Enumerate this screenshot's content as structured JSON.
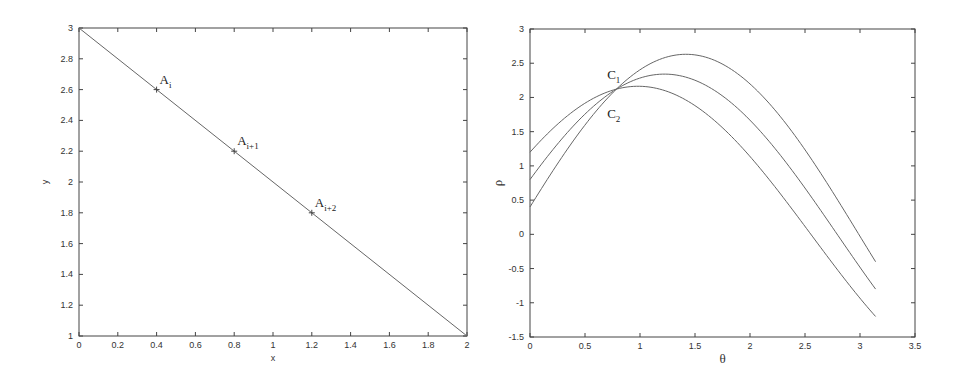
{
  "chart_data": [
    {
      "type": "line",
      "title": "",
      "xlabel": "x",
      "ylabel": "y",
      "xlim": [
        0,
        2
      ],
      "ylim": [
        1,
        3
      ],
      "grid": false,
      "xticks": [
        "0",
        "0.2",
        "0.4",
        "0.6",
        "0.8",
        "1",
        "1.2",
        "1.4",
        "1.6",
        "1.8",
        "2"
      ],
      "yticks": [
        "1",
        "1.2",
        "1.4",
        "1.6",
        "1.8",
        "2",
        "2.2",
        "2.4",
        "2.6",
        "2.8",
        "3"
      ],
      "series": [
        {
          "name": "line",
          "x": [
            0,
            2
          ],
          "y": [
            3,
            1
          ]
        }
      ],
      "markers": [
        {
          "x": 0.4,
          "y": 2.6,
          "label": "A",
          "sub": "i"
        },
        {
          "x": 0.8,
          "y": 2.2,
          "label": "A",
          "sub": "i+1"
        },
        {
          "x": 1.2,
          "y": 1.8,
          "label": "A",
          "sub": "i+2"
        }
      ]
    },
    {
      "type": "line",
      "title": "",
      "xlabel": "θ",
      "ylabel": "ρ",
      "xlim": [
        0,
        3.5
      ],
      "ylim": [
        -1.5,
        3
      ],
      "grid": false,
      "xticks": [
        "0",
        "0.5",
        "1",
        "1.5",
        "2",
        "2.5",
        "3",
        "3.5"
      ],
      "yticks": [
        "-1.5",
        "-1",
        "-0.5",
        "0",
        "0.5",
        "1",
        "1.5",
        "2",
        "2.5",
        "3"
      ],
      "series": [
        {
          "name": "ρ = 0.4cosθ + 2.6sinθ",
          "x_point": 0.4,
          "y_point": 2.6,
          "theta_range": [
            0,
            3.1416
          ],
          "start": 0.4,
          "peak": 2.63,
          "end": -0.4
        },
        {
          "name": "ρ = 0.8cosθ + 2.2sinθ",
          "x_point": 0.8,
          "y_point": 2.2,
          "theta_range": [
            0,
            3.1416
          ],
          "start": 0.8,
          "peak": 2.34,
          "end": -0.8
        },
        {
          "name": "ρ = 1.2cosθ + 1.8sinθ",
          "x_point": 1.2,
          "y_point": 1.8,
          "theta_range": [
            0,
            3.1416
          ],
          "start": 1.2,
          "peak": 2.16,
          "end": -1.2
        }
      ],
      "annotations": [
        {
          "label": "C",
          "sub": "1",
          "theta": 0.72,
          "rho": 2.3
        },
        {
          "label": "C",
          "sub": "2",
          "theta": 0.72,
          "rho": 1.85
        }
      ]
    }
  ],
  "panels": {
    "left": {
      "xlabel": "x",
      "ylabel": "y"
    },
    "right": {
      "xlabel": "θ",
      "ylabel": "ρ"
    }
  }
}
